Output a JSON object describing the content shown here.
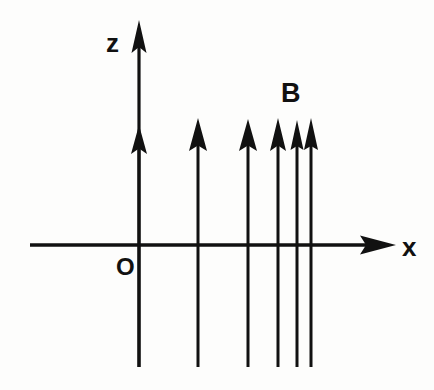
{
  "figure": {
    "title": "",
    "background_color": "#fdfdfc",
    "ink_color": "#111111",
    "labels": {
      "z_axis": "z",
      "x_axis": "x",
      "origin": "O",
      "field": "B"
    },
    "axes": {
      "vertical": {
        "name": "z-axis",
        "label": "z",
        "direction": "up",
        "arrow_tip": {
          "x": 139,
          "y": 20
        },
        "line_from": {
          "x": 139,
          "y": 367
        },
        "line_to": {
          "x": 139,
          "y": 20
        },
        "label_position": {
          "x": 108,
          "y": 50
        }
      },
      "horizontal": {
        "name": "x-axis",
        "label": "x",
        "direction": "right",
        "arrow_tip": {
          "x": 396,
          "y": 245
        },
        "line_from": {
          "x": 30,
          "y": 245
        },
        "line_to": {
          "x": 396,
          "y": 245
        },
        "label_position": {
          "x": 403,
          "y": 255
        }
      },
      "origin": {
        "name": "origin",
        "label": "O",
        "position": {
          "x": 139,
          "y": 245
        },
        "label_position": {
          "x": 117,
          "y": 274
        }
      }
    },
    "field_label": {
      "text": "B",
      "position": {
        "x": 282,
        "y": 101
      }
    },
    "field_lines": [
      {
        "x": 139,
        "top_y": 125,
        "bottom_y": 367,
        "head_base_y": 153,
        "head_half_width": 8
      },
      {
        "x": 198,
        "top_y": 118,
        "bottom_y": 367,
        "head_base_y": 150,
        "head_half_width": 9
      },
      {
        "x": 248,
        "top_y": 119,
        "bottom_y": 367,
        "head_base_y": 150,
        "head_half_width": 9
      },
      {
        "x": 278,
        "top_y": 118,
        "bottom_y": 367,
        "head_base_y": 150,
        "head_half_width": 8
      },
      {
        "x": 297,
        "top_y": 120,
        "bottom_y": 367,
        "head_base_y": 150,
        "head_half_width": 7
      },
      {
        "x": 311,
        "top_y": 118,
        "bottom_y": 367,
        "head_base_y": 150,
        "head_half_width": 7
      }
    ],
    "stroke_widths": {
      "axis": 3.2,
      "field_line": 3.0
    }
  }
}
